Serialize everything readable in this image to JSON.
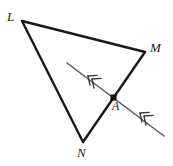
{
  "figure": {
    "type": "geometry-diagram",
    "background_color": "#ffffff",
    "stroke_color": "#1a1a1a",
    "transversal_color": "#555555"
  },
  "labels": {
    "L": "L",
    "M": "M",
    "N": "N",
    "A": "A"
  },
  "points": {
    "L": {
      "x": 22,
      "y": 21
    },
    "M": {
      "x": 145,
      "y": 52
    },
    "N": {
      "x": 83,
      "y": 142
    },
    "A": {
      "x": 114,
      "y": 98
    }
  },
  "segments": [
    {
      "name": "LM",
      "from": "L",
      "to": "M"
    },
    {
      "name": "LN",
      "from": "L",
      "to": "N"
    },
    {
      "name": "MN",
      "from": "M",
      "to": "N"
    }
  ],
  "transversal": {
    "name": "transversal-line",
    "start": {
      "x": 67,
      "y": 63
    },
    "end": {
      "x": 164,
      "y": 136
    },
    "through": "A",
    "marks": [
      {
        "name": "arrow-mark-upper-left",
        "x": 88,
        "y": 76
      },
      {
        "name": "arrow-mark-lower-right",
        "x": 140,
        "y": 113
      }
    ]
  }
}
